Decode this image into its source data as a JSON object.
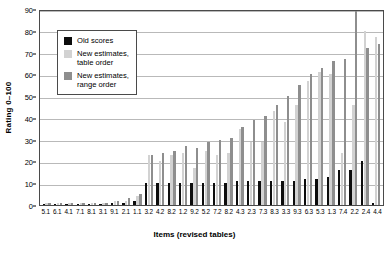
{
  "chart_data": {
    "type": "bar",
    "title": "",
    "xlabel": "Items (revised tables)",
    "ylabel": "Rating 0–100",
    "ylim": [
      0,
      90
    ],
    "ytick_step": 10,
    "yticks": [
      0,
      10,
      20,
      30,
      40,
      50,
      60,
      70,
      80,
      90
    ],
    "grid": true,
    "legend_position": "upper-left-inside",
    "categories": [
      "5.1",
      "6.1",
      "4.1",
      "7.1",
      "8.1",
      "3.1",
      "9.1",
      "2.1",
      "1.1",
      "3.2",
      "4.2",
      "8.2",
      "1.2",
      "9.2",
      "5.2",
      "7.2",
      "8.2",
      "4.3",
      "2.3",
      "7.3",
      "8.3",
      "3.3",
      "9.3",
      "6.3",
      "5.3",
      "1.3",
      "7.4",
      "2.2",
      "2.4",
      "4.4"
    ],
    "series": [
      {
        "name": "Old scores",
        "color": "#0d0d0d",
        "values": [
          0.5,
          0.5,
          0.5,
          0.5,
          0.5,
          0.5,
          1,
          1,
          2,
          10,
          10,
          10,
          10,
          10,
          10,
          10,
          10,
          11,
          11,
          11,
          11,
          11,
          11,
          12,
          12,
          13,
          16,
          16,
          20,
          1
        ]
      },
      {
        "name": "New estimates,\ntable order",
        "color": "#d2d2d2",
        "values": [
          1,
          1,
          1,
          1,
          1,
          1,
          2,
          2,
          4,
          23,
          20,
          23,
          24,
          17,
          25,
          23,
          24,
          35,
          29,
          29,
          43,
          38,
          46,
          57,
          61,
          60,
          24,
          46,
          80,
          77
        ]
      },
      {
        "name": "New estimates,\nrange order",
        "color": "#8e8e8e",
        "values": [
          1,
          1,
          1,
          1,
          1,
          1,
          2,
          3,
          5,
          23,
          24,
          25,
          27,
          26,
          29,
          30,
          31,
          36,
          39,
          41,
          46,
          50,
          55,
          60,
          63,
          66,
          67,
          89,
          72,
          74
        ]
      }
    ]
  },
  "legend": {
    "entries": [
      {
        "label": "Old scores",
        "swatch": "old"
      },
      {
        "label": "New estimates,\ntable order",
        "swatch": "table"
      },
      {
        "label": "New estimates,\nrange order",
        "swatch": "range"
      }
    ]
  }
}
